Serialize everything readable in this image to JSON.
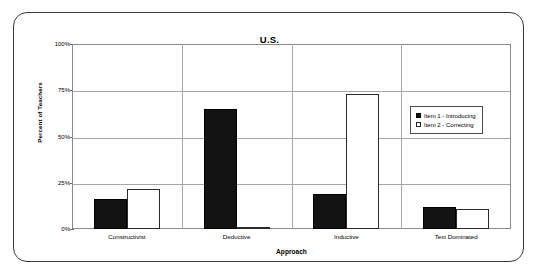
{
  "chart_data": {
    "type": "bar",
    "title": "U.S.",
    "xlabel": "Approach",
    "ylabel": "Percent of Teachers",
    "categories": [
      "Constructivist",
      "Deductive",
      "Inductive",
      "Text Dominated"
    ],
    "series": [
      {
        "name": "Item 1 - Introducing",
        "color": "#131313",
        "values": [
          16,
          65,
          19,
          12
        ]
      },
      {
        "name": "Item 2 - Correcting",
        "color": "#ffffff",
        "values": [
          21.5,
          0.5,
          73,
          11
        ]
      }
    ],
    "ylim": [
      0,
      100
    ],
    "ytick_labels": [
      "0%",
      "25%",
      "50%",
      "75%",
      "100%"
    ],
    "ytick_values": [
      0,
      25,
      50,
      75,
      100
    ],
    "grid": true,
    "legend_position": "right-upper"
  },
  "legend": {
    "items": [
      {
        "label": "Item 1 - Introducing",
        "swatch": "filled-black-square"
      },
      {
        "label": "Item 2 - Correcting",
        "swatch": "open-white-square"
      }
    ]
  },
  "colors": {
    "frame": "#3a3a3a",
    "gridline": "#a6a6a6",
    "plot_border": "#8a8a8a",
    "series_1": "#131313",
    "series_2": "#ffffff",
    "text": "#000000"
  }
}
